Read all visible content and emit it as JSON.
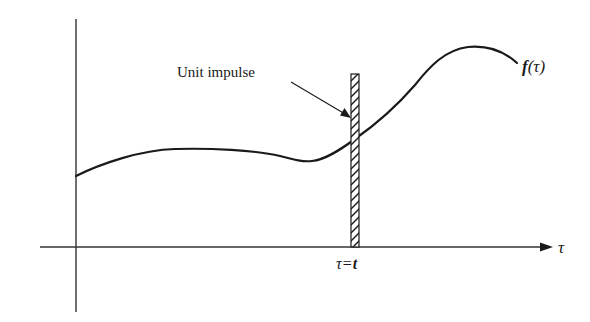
{
  "diagram": {
    "labels": {
      "unit_impulse": "Unit impulse",
      "function": "f(τ)",
      "function_name": "f",
      "function_arg": "(τ)",
      "axis_variable": "τ",
      "impulse_position": "τ = t",
      "impulse_position_lhs": "τ",
      "impulse_position_eq": "=",
      "impulse_position_rhs": "t"
    },
    "colors": {
      "stroke": "#1a1a1a",
      "axis": "#333333",
      "background": "#ffffff"
    },
    "axes": {
      "horizontal": {
        "x1": 40,
        "x2": 552,
        "y": 247,
        "arrow": true
      },
      "vertical": {
        "x": 76,
        "y1": 19,
        "y2": 312,
        "arrow": false
      }
    },
    "impulse": {
      "x": 351,
      "width": 8,
      "y_top": 74,
      "y_bottom": 247,
      "hatched": true
    },
    "curve_points": [
      [
        76,
        176
      ],
      [
        120,
        158
      ],
      [
        175,
        149
      ],
      [
        240,
        151
      ],
      [
        280,
        156
      ],
      [
        310,
        161
      ],
      [
        330,
        156
      ],
      [
        355,
        139
      ],
      [
        400,
        105
      ],
      [
        435,
        62
      ],
      [
        470,
        46
      ],
      [
        500,
        50
      ],
      [
        517,
        63
      ]
    ]
  }
}
